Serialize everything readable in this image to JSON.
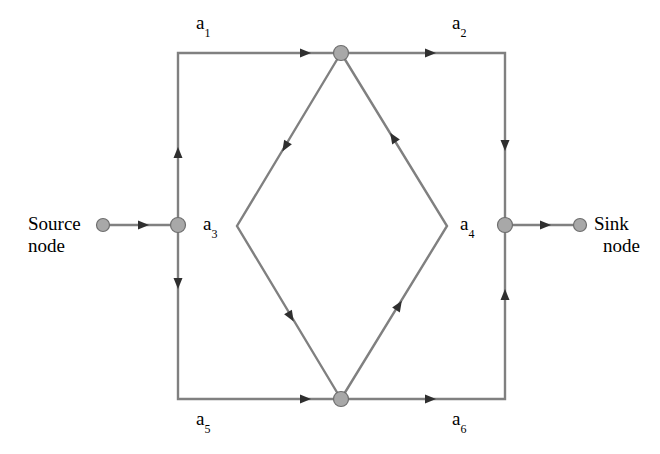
{
  "diagram": {
    "type": "directed-graph",
    "colors": {
      "edge": "#808080",
      "node_fill": "#a8a8a8",
      "node_stroke": "#6e6e6e",
      "arrow": "#3a3a3a",
      "text": "#000000",
      "background": "#ffffff"
    },
    "terminals": {
      "source": {
        "line1": "Source",
        "line2": "node"
      },
      "sink": {
        "line1": "Sink",
        "line2": "node"
      }
    },
    "arcs": [
      {
        "id": "a1",
        "base": "a",
        "sub": "1",
        "from": "left-node",
        "to": "top-node",
        "path": "top-left"
      },
      {
        "id": "a2",
        "base": "a",
        "sub": "2",
        "from": "top-node",
        "to": "right-node",
        "path": "top-right"
      },
      {
        "id": "a3",
        "base": "a",
        "sub": "3",
        "from": "top-node",
        "to": "bottom-node",
        "path": "diamond-left"
      },
      {
        "id": "a4",
        "base": "a",
        "sub": "4",
        "from": "bottom-node",
        "to": "top-node",
        "path": "diamond-right"
      },
      {
        "id": "a5",
        "base": "a",
        "sub": "5",
        "from": "left-node",
        "to": "bottom-node",
        "path": "bottom-left"
      },
      {
        "id": "a6",
        "base": "a",
        "sub": "6",
        "from": "bottom-node",
        "to": "right-node",
        "path": "bottom-right"
      }
    ],
    "nodes": [
      {
        "id": "source-terminal",
        "x": 103,
        "y": 225,
        "r": 6.5
      },
      {
        "id": "left-node",
        "x": 178,
        "y": 225,
        "r": 7.5
      },
      {
        "id": "top-node",
        "x": 341,
        "y": 53,
        "r": 7.5
      },
      {
        "id": "bottom-node",
        "x": 341,
        "y": 399,
        "r": 7.5
      },
      {
        "id": "right-node",
        "x": 505,
        "y": 225,
        "r": 7.5
      },
      {
        "id": "sink-terminal",
        "x": 580,
        "y": 225,
        "r": 6.5
      }
    ]
  }
}
